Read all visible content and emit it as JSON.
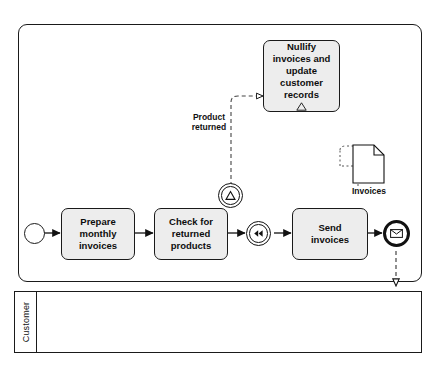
{
  "diagram": {
    "type": "bpmn-process",
    "pools": [
      {
        "id": "main",
        "label": ""
      },
      {
        "id": "customer",
        "label": "Customer"
      }
    ],
    "tasks": [
      {
        "id": "prepare",
        "line1": "Prepare",
        "line2": "monthly",
        "line3": "invoices"
      },
      {
        "id": "check",
        "line1": "Check for",
        "line2": "returned",
        "line3": "products"
      },
      {
        "id": "send",
        "line1": "Send",
        "line2": "invoices",
        "line3": ""
      },
      {
        "id": "nullify",
        "line1": "Nullify",
        "line2": "invoices  and",
        "line3": "update",
        "line4": "customer",
        "line5": "records"
      }
    ],
    "events": [
      {
        "id": "start",
        "kind": "start-none",
        "label": ""
      },
      {
        "id": "boundary-signal",
        "kind": "boundary-signal",
        "label": "Product returned"
      },
      {
        "id": "intermediate-signal",
        "kind": "intermediate-catch-signal",
        "label": ""
      },
      {
        "id": "end-message",
        "kind": "end-message",
        "label": ""
      }
    ],
    "labels": {
      "product_returned": "Product\nreturned",
      "product_returned_line1": "Product",
      "product_returned_line2": "returned",
      "invoices_data": "Invoices"
    },
    "data_objects": [
      {
        "id": "invoices-doc",
        "label": "Invoices"
      }
    ],
    "icons": {
      "signal": "signal-icon",
      "message": "envelope-icon",
      "rewind": "double-triangle-icon",
      "document": "document-icon"
    },
    "colors": {
      "task_fill": "#ededed",
      "stroke": "#1a1a1a",
      "background": "#ffffff"
    }
  }
}
